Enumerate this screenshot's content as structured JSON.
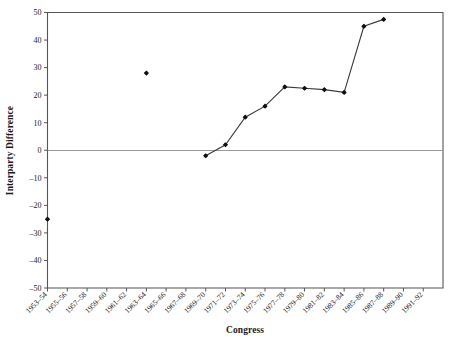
{
  "chart_data": {
    "type": "line",
    "title": "",
    "xlabel": "Congress",
    "ylabel": "Interparty Difference",
    "ylim": [
      -50,
      50
    ],
    "yticks": [
      50,
      40,
      30,
      20,
      10,
      0,
      -10,
      -20,
      -30,
      -40,
      -50
    ],
    "ytick_labels": [
      "50",
      "40",
      "30",
      "20",
      "10",
      "0",
      "–10",
      "–20",
      "–30",
      "–40",
      "–50"
    ],
    "grid": false,
    "legend": "none",
    "zero_reference_line": true,
    "categories": [
      "1953–54",
      "1955–56",
      "1957–58",
      "1959–60",
      "1961–62",
      "1963–64",
      "1965–66",
      "1967–68",
      "1969–70",
      "1971–72",
      "1973–74",
      "1975–76",
      "1977–78",
      "1979–80",
      "1981–82",
      "1983–84",
      "1985–86",
      "1987–88",
      "1989–90",
      "1991–92"
    ],
    "series": [
      {
        "name": "Interparty Difference",
        "values": [
          -25,
          null,
          null,
          null,
          null,
          28,
          null,
          null,
          -2,
          2,
          12,
          16,
          23,
          22.5,
          22,
          21,
          45,
          47.5,
          null,
          null
        ],
        "marker": "filled-diamond",
        "connected_from": "1969–70",
        "connected_to": "1987–88"
      }
    ],
    "points": [
      {
        "category": "1953–54",
        "value": -25,
        "connected": false
      },
      {
        "category": "1963–64",
        "value": 28,
        "connected": false
      },
      {
        "category": "1969–70",
        "value": -2,
        "connected": true
      },
      {
        "category": "1971–72",
        "value": 2,
        "connected": true
      },
      {
        "category": "1973–74",
        "value": 12,
        "connected": true
      },
      {
        "category": "1975–76",
        "value": 16,
        "connected": true
      },
      {
        "category": "1977–78",
        "value": 23,
        "connected": true
      },
      {
        "category": "1979–80",
        "value": 22.5,
        "connected": true
      },
      {
        "category": "1981–82",
        "value": 22,
        "connected": true
      },
      {
        "category": "1983–84",
        "value": 21,
        "connected": true
      },
      {
        "category": "1985–86",
        "value": 45,
        "connected": true
      },
      {
        "category": "1987–88",
        "value": 47.5,
        "connected": true
      }
    ],
    "colors": {
      "line": "#3a3a3a",
      "marker": "#101010",
      "axis": "#555555",
      "zero_line": "#9a9a9a",
      "background": "#ffffff",
      "text": "#1a1a1a"
    }
  }
}
